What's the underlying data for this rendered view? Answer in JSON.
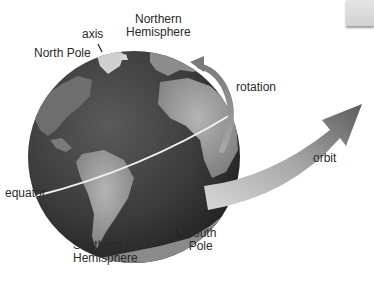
{
  "diagram": {
    "labels": {
      "northern_hemisphere": [
        "Northern",
        "Hemisphere"
      ],
      "axis": "axis",
      "north_pole": "North Pole",
      "rotation": "rotation",
      "orbit": "orbit",
      "equator": "equator",
      "southern_hemisphere": [
        "Southern",
        "Hemisphere"
      ],
      "south_pole": [
        "South",
        "Pole"
      ]
    },
    "colors": {
      "background": "#ffffff",
      "ocean": "#3c3c3c",
      "land": "#8a8a8a",
      "equator_line": "#f2f2f2",
      "arrow": "#9a9a9a",
      "text": "#2a2a2a"
    }
  }
}
